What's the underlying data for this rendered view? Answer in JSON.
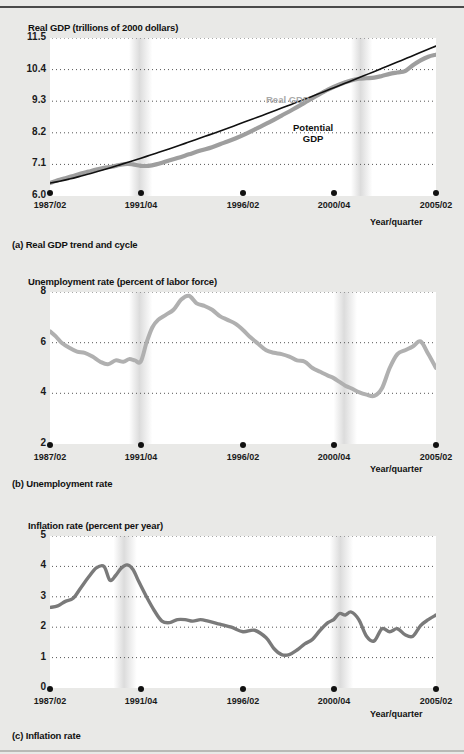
{
  "figure": {
    "background_color": "#e9e9e7",
    "plot_background_color": "#ffffff",
    "gridline_color": "#555555",
    "recession_band_color": "#dcdcdc",
    "real_gdp_color": "#9e9e9e",
    "potential_gdp_color": "#111111",
    "unemployment_color": "#b0b0b0",
    "inflation_color": "#7a7a7a"
  },
  "panel_a": {
    "axis_title": "Real GDP (trillions of 2000 dollars)",
    "caption": "(a) Real GDP trend and cycle",
    "xaxis_title": "Year/quarter",
    "series_label_real": "Real GDP",
    "series_label_potential_line1": "Potential",
    "series_label_potential_line2": "GDP"
  },
  "panel_b": {
    "axis_title": "Unemployment rate (percent of labor force)",
    "caption": "(b) Unemployment rate",
    "xaxis_title": "Year/quarter"
  },
  "panel_c": {
    "axis_title": "Inflation rate (percent per year)",
    "caption": "(c) Inflation rate",
    "xaxis_title": "Year/quarter"
  },
  "chart_data": [
    {
      "id": "panel_a",
      "type": "line",
      "title": "Real GDP (trillions of 2000 dollars)",
      "caption": "(a) Real GDP trend and cycle",
      "xlabel": "Year/quarter",
      "ylabel": "Real GDP (trillions of 2000 dollars)",
      "ylim": [
        6.0,
        11.5
      ],
      "yticks": [
        11.5,
        10.4,
        9.3,
        8.2,
        7.1,
        6.0
      ],
      "ytick_labels": [
        "11.5",
        "10.4",
        "9.3",
        "8.2",
        "7.1",
        "6.0"
      ],
      "xticks": [
        "1987/02",
        "1991/04",
        "1996/02",
        "2000/04",
        "2005/02"
      ],
      "xtick_positions": [
        0.0,
        0.236,
        0.5,
        0.736,
        1.0
      ],
      "grid": true,
      "legend_position": "inline-annotation",
      "recession_bands": [
        {
          "start": 0.215,
          "end": 0.255
        },
        {
          "start": 0.79,
          "end": 0.825
        }
      ],
      "series": [
        {
          "name": "Real GDP",
          "color": "#9e9e9e",
          "x": [
            0.0,
            0.02,
            0.04,
            0.06,
            0.08,
            0.1,
            0.12,
            0.14,
            0.16,
            0.18,
            0.2,
            0.215,
            0.235,
            0.255,
            0.275,
            0.3,
            0.33,
            0.36,
            0.39,
            0.42,
            0.45,
            0.48,
            0.51,
            0.54,
            0.57,
            0.6,
            0.63,
            0.66,
            0.69,
            0.72,
            0.75,
            0.78,
            0.8,
            0.82,
            0.84,
            0.86,
            0.88,
            0.9,
            0.92,
            0.94,
            0.96,
            0.98,
            1.0
          ],
          "values": [
            6.45,
            6.55,
            6.62,
            6.7,
            6.78,
            6.85,
            6.92,
            6.98,
            7.02,
            7.08,
            7.12,
            7.1,
            7.05,
            7.05,
            7.1,
            7.2,
            7.32,
            7.45,
            7.58,
            7.7,
            7.85,
            8.0,
            8.18,
            8.38,
            8.58,
            8.8,
            9.02,
            9.25,
            9.48,
            9.7,
            9.88,
            10.02,
            10.08,
            10.1,
            10.12,
            10.18,
            10.25,
            10.3,
            10.35,
            10.55,
            10.72,
            10.85,
            10.92
          ]
        },
        {
          "name": "Potential GDP",
          "color": "#111111",
          "x": [
            0.0,
            1.0
          ],
          "values": [
            6.45,
            11.22
          ],
          "note": "smooth upward trend line from about 6.45 in 1987/02 to about 11.2 in 2005/02"
        }
      ]
    },
    {
      "id": "panel_b",
      "type": "line",
      "title": "Unemployment rate (percent of labor force)",
      "caption": "(b) Unemployment rate",
      "xlabel": "Year/quarter",
      "ylabel": "Unemployment rate (percent of labor force)",
      "ylim": [
        2,
        8
      ],
      "yticks": [
        8,
        6,
        4,
        2
      ],
      "ytick_labels": [
        "8",
        "6",
        "4",
        "2"
      ],
      "xticks": [
        "1987/02",
        "1991/04",
        "1996/02",
        "2000/04",
        "2005/02"
      ],
      "xtick_positions": [
        0.0,
        0.236,
        0.5,
        0.736,
        1.0
      ],
      "grid": true,
      "recession_bands": [
        {
          "start": 0.215,
          "end": 0.255
        },
        {
          "start": 0.745,
          "end": 0.785
        }
      ],
      "series": [
        {
          "name": "Unemployment rate",
          "color": "#b0b0b0",
          "x": [
            0.0,
            0.015,
            0.03,
            0.05,
            0.07,
            0.09,
            0.11,
            0.13,
            0.15,
            0.17,
            0.19,
            0.205,
            0.22,
            0.235,
            0.25,
            0.265,
            0.28,
            0.3,
            0.32,
            0.34,
            0.36,
            0.38,
            0.4,
            0.42,
            0.44,
            0.46,
            0.48,
            0.5,
            0.52,
            0.54,
            0.56,
            0.58,
            0.6,
            0.62,
            0.64,
            0.66,
            0.68,
            0.7,
            0.72,
            0.735,
            0.75,
            0.765,
            0.78,
            0.8,
            0.82,
            0.84,
            0.86,
            0.88,
            0.9,
            0.92,
            0.94,
            0.96,
            0.98,
            1.0
          ],
          "values": [
            6.45,
            6.25,
            6.0,
            5.8,
            5.65,
            5.6,
            5.45,
            5.25,
            5.15,
            5.3,
            5.25,
            5.35,
            5.3,
            5.25,
            6.0,
            6.6,
            6.9,
            7.1,
            7.3,
            7.7,
            7.85,
            7.55,
            7.45,
            7.3,
            7.05,
            6.9,
            6.75,
            6.5,
            6.2,
            5.95,
            5.7,
            5.6,
            5.55,
            5.45,
            5.3,
            5.25,
            5.0,
            4.85,
            4.7,
            4.6,
            4.45,
            4.3,
            4.2,
            4.05,
            3.95,
            3.9,
            4.2,
            5.0,
            5.55,
            5.7,
            5.85,
            6.05,
            5.55,
            5.0
          ]
        }
      ]
    },
    {
      "id": "panel_c",
      "type": "line",
      "title": "Inflation rate (percent per year)",
      "caption": "(c) Inflation rate",
      "xlabel": "Year/quarter",
      "ylabel": "Inflation rate (percent per year)",
      "ylim": [
        0,
        5
      ],
      "yticks": [
        5,
        4,
        3,
        2,
        1,
        0
      ],
      "ytick_labels": [
        "5",
        "4",
        "3",
        "2",
        "1",
        "0"
      ],
      "xticks": [
        "1987/02",
        "1991/04",
        "1996/02",
        "2000/04",
        "2005/02"
      ],
      "xtick_positions": [
        0.0,
        0.236,
        0.5,
        0.736,
        1.0
      ],
      "grid": true,
      "recession_bands": [
        {
          "start": 0.175,
          "end": 0.215
        },
        {
          "start": 0.735,
          "end": 0.775
        }
      ],
      "series": [
        {
          "name": "Inflation rate",
          "color": "#7a7a7a",
          "x": [
            0.0,
            0.02,
            0.04,
            0.06,
            0.08,
            0.1,
            0.12,
            0.14,
            0.155,
            0.17,
            0.185,
            0.2,
            0.215,
            0.23,
            0.25,
            0.27,
            0.29,
            0.31,
            0.33,
            0.35,
            0.37,
            0.39,
            0.41,
            0.44,
            0.47,
            0.5,
            0.53,
            0.56,
            0.58,
            0.6,
            0.62,
            0.64,
            0.66,
            0.68,
            0.7,
            0.72,
            0.735,
            0.75,
            0.765,
            0.78,
            0.8,
            0.82,
            0.84,
            0.86,
            0.88,
            0.9,
            0.92,
            0.94,
            0.96,
            0.98,
            1.0
          ],
          "values": [
            2.65,
            2.7,
            2.85,
            2.95,
            3.3,
            3.65,
            3.95,
            4.0,
            3.55,
            3.7,
            3.95,
            4.05,
            3.9,
            3.5,
            3.0,
            2.55,
            2.2,
            2.15,
            2.25,
            2.25,
            2.2,
            2.25,
            2.2,
            2.1,
            2.0,
            1.85,
            1.9,
            1.65,
            1.3,
            1.1,
            1.1,
            1.25,
            1.45,
            1.6,
            1.9,
            2.15,
            2.25,
            2.45,
            2.4,
            2.5,
            2.25,
            1.7,
            1.55,
            1.95,
            1.85,
            1.95,
            1.75,
            1.7,
            2.05,
            2.25,
            2.4
          ]
        }
      ]
    }
  ]
}
